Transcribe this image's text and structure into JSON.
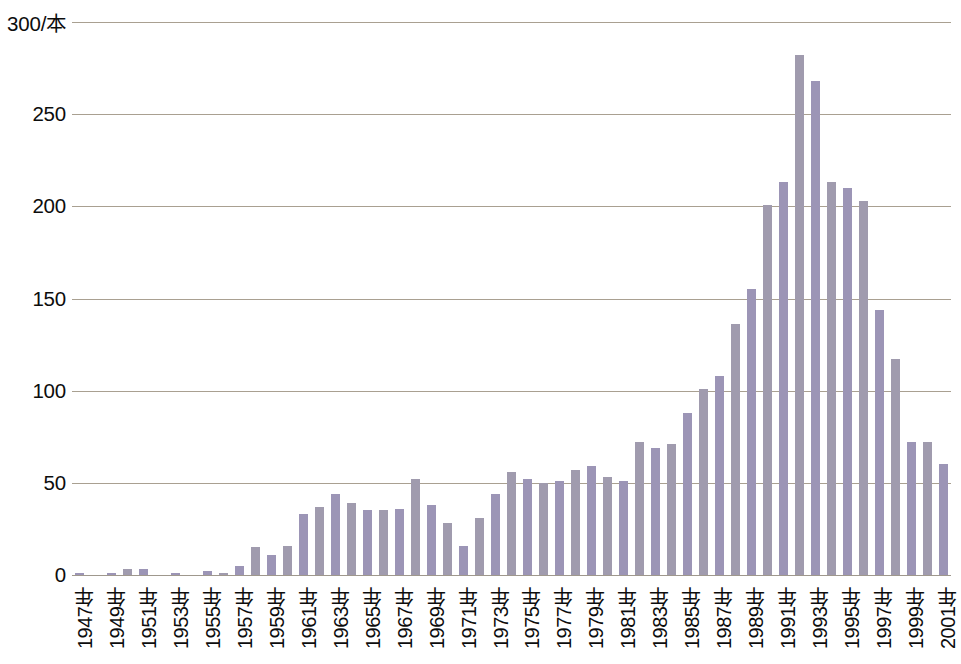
{
  "chart_data": {
    "type": "bar",
    "title": "",
    "subtitle": "",
    "xlabel": "",
    "ylabel": "300/本",
    "unit_label": "300/本",
    "unit_suffix": "本",
    "year_suffix": "年",
    "ylim": [
      0,
      300
    ],
    "grid": true,
    "grid_axis": "y",
    "legend": "none",
    "yticks": [
      0,
      50,
      100,
      150,
      200,
      250,
      300
    ],
    "ytick_labels": [
      "0",
      "50",
      "100",
      "150",
      "200",
      "250",
      "300/本"
    ],
    "categories": [
      "1947年",
      "1948年",
      "1949年",
      "1950年",
      "1951年",
      "1952年",
      "1953年",
      "1954年",
      "1955年",
      "1956年",
      "1957年",
      "1958年",
      "1959年",
      "1960年",
      "1961年",
      "1962年",
      "1963年",
      "1964年",
      "1965年",
      "1966年",
      "1967年",
      "1968年",
      "1969年",
      "1970年",
      "1971年",
      "1972年",
      "1973年",
      "1974年",
      "1975年",
      "1976年",
      "1977年",
      "1978年",
      "1979年",
      "1980年",
      "1981年",
      "1982年",
      "1983年",
      "1984年",
      "1985年",
      "1986年",
      "1987年",
      "1988年",
      "1989年",
      "1990年",
      "1991年",
      "1992年",
      "1993年",
      "1994年",
      "1995年",
      "1996年",
      "1997年",
      "1998年",
      "1999年",
      "2000年",
      "2001年"
    ],
    "x": [
      1947,
      1948,
      1949,
      1950,
      1951,
      1952,
      1953,
      1954,
      1955,
      1956,
      1957,
      1958,
      1959,
      1960,
      1961,
      1962,
      1963,
      1964,
      1965,
      1966,
      1967,
      1968,
      1969,
      1970,
      1971,
      1972,
      1973,
      1974,
      1975,
      1976,
      1977,
      1978,
      1979,
      1980,
      1981,
      1982,
      1983,
      1984,
      1985,
      1986,
      1987,
      1988,
      1989,
      1990,
      1991,
      1992,
      1993,
      1994,
      1995,
      1996,
      1997,
      1998,
      1999,
      2000,
      2001
    ],
    "values": [
      1,
      0,
      1,
      3,
      3,
      0,
      1,
      0,
      2,
      1,
      5,
      15,
      11,
      16,
      33,
      37,
      44,
      39,
      35,
      35,
      36,
      52,
      38,
      28,
      16,
      31,
      44,
      56,
      52,
      50,
      51,
      57,
      59,
      53,
      51,
      72,
      69,
      71,
      88,
      101,
      108,
      136,
      155,
      201,
      213,
      282,
      268,
      213,
      210,
      203,
      144,
      117,
      72,
      72,
      60
    ],
    "tick_label_years": [
      "1947年",
      "1949年",
      "1951年",
      "1953年",
      "1955年",
      "1957年",
      "1959年",
      "1961年",
      "1963年",
      "1965年",
      "1967年",
      "1969年",
      "1971年",
      "1973年",
      "1975年",
      "1977年",
      "1979年",
      "1981年",
      "1983年",
      "1985年",
      "1987年",
      "1989年",
      "1991年",
      "1993年",
      "1995年",
      "1997年",
      "1999年",
      "2001年"
    ],
    "bar_color_primary": "#9c95b6",
    "bar_color_secondary": "#a09bae",
    "gridline_color": "#9a8f7e",
    "background_color": "#ffffff",
    "text_color": "#0d0d0d",
    "peak_year": "1989年",
    "peak_value": 282
  }
}
